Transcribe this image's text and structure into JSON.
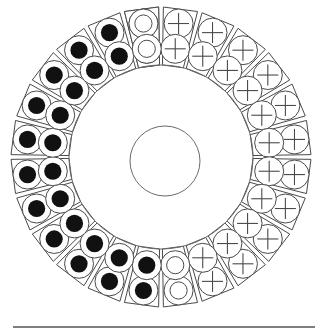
{
  "figure": {
    "title": "Stator winding cross-section",
    "canvas": {
      "width": 325,
      "height": 336,
      "background": "#ffffff"
    }
  },
  "geometry": {
    "center_x": 161,
    "center_y": 157,
    "outer_radius": 152,
    "slot_outer_radius": 150,
    "slot_inner_radius": 92,
    "bore_radius": 92,
    "shaft_center_x": 165,
    "shaft_center_y": 161,
    "shaft_radius": 35,
    "slot_count": 24,
    "conductors_per_slot": 2,
    "slot_angular_width_deg": 13.2,
    "conductor_outer_radius_frac": 0.735,
    "conductor_inner_radius_frac": 0.295,
    "conductor_radius_px": 14.5,
    "dot_radius_px": 8.6,
    "inner_ring_radius_px": 8.6,
    "cross_arm_px": 10.5
  },
  "colors": {
    "stroke": "#4a4a4a",
    "ring_stroke": "#6a6a6a",
    "fill": "#ffffff",
    "dot_fill": "#111111",
    "baseline": "#555555",
    "background": "#ffffff"
  },
  "baseline": {
    "label": "horizontal-rule",
    "x1": 13,
    "x2": 315,
    "y": 327,
    "thickness": 1.4
  },
  "legend": {
    "symbols": [
      {
        "key": "dot",
        "glyph": "●",
        "name": "filled-dot",
        "meaning": "current into page"
      },
      {
        "key": "cross",
        "glyph": "+",
        "name": "plus-sign",
        "meaning": "current out of page"
      },
      {
        "key": "ring",
        "glyph": "○",
        "name": "open-circle",
        "meaning": "no current / neutral"
      }
    ]
  },
  "chart_data": {
    "type": "diagram",
    "title": "Stator winding cross-section",
    "slot_count": 24,
    "angle_step_deg": 15,
    "start_angle_deg": -97.5,
    "slots": [
      {
        "index": 0,
        "angle_deg": -97.5,
        "outer": "ring",
        "inner": "ring"
      },
      {
        "index": 1,
        "angle_deg": -82.5,
        "outer": "cross",
        "inner": "cross"
      },
      {
        "index": 2,
        "angle_deg": -67.5,
        "outer": "cross",
        "inner": "cross"
      },
      {
        "index": 3,
        "angle_deg": -52.5,
        "outer": "cross",
        "inner": "cross"
      },
      {
        "index": 4,
        "angle_deg": -37.5,
        "outer": "cross",
        "inner": "cross"
      },
      {
        "index": 5,
        "angle_deg": -22.5,
        "outer": "cross",
        "inner": "cross"
      },
      {
        "index": 6,
        "angle_deg": -7.5,
        "outer": "cross",
        "inner": "cross"
      },
      {
        "index": 7,
        "angle_deg": 7.5,
        "outer": "cross",
        "inner": "cross"
      },
      {
        "index": 8,
        "angle_deg": 22.5,
        "outer": "cross",
        "inner": "cross"
      },
      {
        "index": 9,
        "angle_deg": 37.5,
        "outer": "cross",
        "inner": "cross"
      },
      {
        "index": 10,
        "angle_deg": 52.5,
        "outer": "cross",
        "inner": "cross"
      },
      {
        "index": 11,
        "angle_deg": 67.5,
        "outer": "cross",
        "inner": "cross"
      },
      {
        "index": 12,
        "angle_deg": 82.5,
        "outer": "ring",
        "inner": "ring"
      },
      {
        "index": 13,
        "angle_deg": 97.5,
        "outer": "dot",
        "inner": "dot"
      },
      {
        "index": 14,
        "angle_deg": 112.5,
        "outer": "dot",
        "inner": "dot"
      },
      {
        "index": 15,
        "angle_deg": 127.5,
        "outer": "dot",
        "inner": "dot"
      },
      {
        "index": 16,
        "angle_deg": 142.5,
        "outer": "dot",
        "inner": "dot"
      },
      {
        "index": 17,
        "angle_deg": 157.5,
        "outer": "dot",
        "inner": "dot"
      },
      {
        "index": 18,
        "angle_deg": 172.5,
        "outer": "dot",
        "inner": "dot"
      },
      {
        "index": 19,
        "angle_deg": 187.5,
        "outer": "dot",
        "inner": "dot"
      },
      {
        "index": 20,
        "angle_deg": 202.5,
        "outer": "dot",
        "inner": "dot"
      },
      {
        "index": 21,
        "angle_deg": 217.5,
        "outer": "dot",
        "inner": "dot"
      },
      {
        "index": 22,
        "angle_deg": 232.5,
        "outer": "dot",
        "inner": "dot"
      },
      {
        "index": 23,
        "angle_deg": 247.5,
        "outer": "dot",
        "inner": "dot"
      },
      {
        "index": 24,
        "angle_deg": 262.5,
        "outer": "ring",
        "inner": "ring"
      }
    ]
  }
}
